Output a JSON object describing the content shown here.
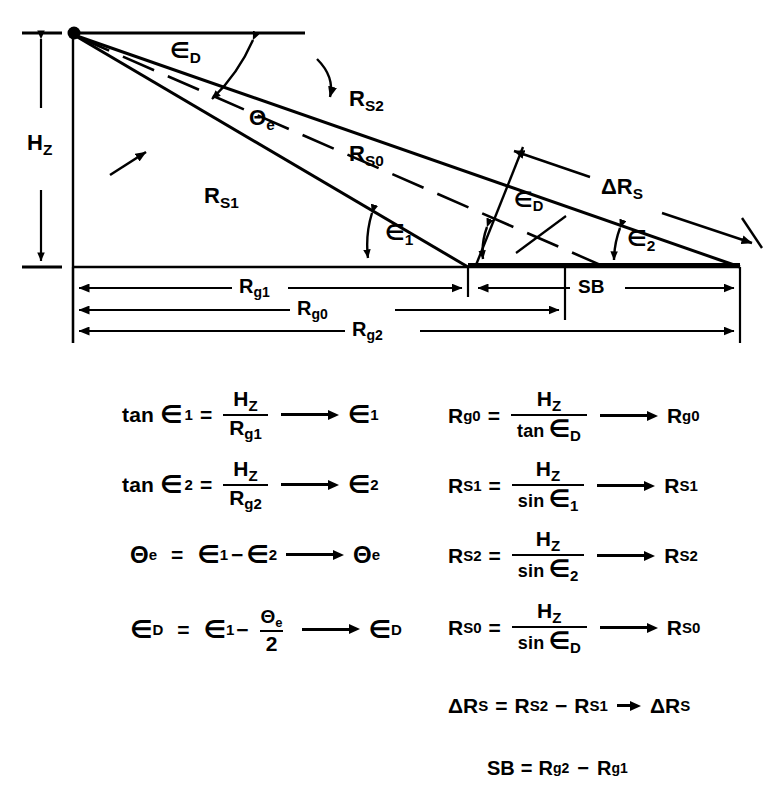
{
  "figure": {
    "type": "geometry-diagram",
    "colors": {
      "line": "#000000",
      "background": "#ffffff"
    },
    "labels": {
      "height": "H",
      "height_sub": "Z",
      "ray_upper": "R",
      "ray_upper_sub": "S2",
      "ray_middle": "R",
      "ray_middle_sub": "S0",
      "ray_lower": "R",
      "ray_lower_sub": "S1",
      "angle_depression": "∈",
      "angle_depression_sub": "D",
      "angle_beam": "Θ",
      "angle_beam_sub": "e",
      "angle_near": "∈",
      "angle_near_sub": "1",
      "angle_far": "∈",
      "angle_far_sub": "2",
      "delta_range": "ΔR",
      "delta_range_sub": "S",
      "swath": "SB",
      "ground_near": "R",
      "ground_near_sub": "g1",
      "ground_center": "R",
      "ground_center_sub": "g0",
      "ground_far": "R",
      "ground_far_sub": "g2"
    },
    "geometry": {
      "apex": [
        73,
        33
      ],
      "baseline_left": [
        73,
        267
      ],
      "baseline_right": [
        740,
        267
      ],
      "near_ground_point": [
        468,
        267
      ],
      "center_ground_point": [
        565,
        267
      ],
      "top_reference_right": [
        305,
        33
      ],
      "dimension_rows_y": [
        288,
        310,
        331
      ],
      "hz_dimension_x": 41
    }
  },
  "equations": {
    "left_column": [
      {
        "id": "eq-tan-eps1",
        "lhs_fn": "tan",
        "lhs_sym": "∈",
        "lhs_sub": "1",
        "eq": "=",
        "num": "H",
        "num_sub": "Z",
        "den": "R",
        "den_sub": "g1",
        "result": "∈",
        "result_sub": "1"
      },
      {
        "id": "eq-tan-eps2",
        "lhs_fn": "tan",
        "lhs_sym": "∈",
        "lhs_sub": "2",
        "eq": "=",
        "num": "H",
        "num_sub": "Z",
        "den": "R",
        "den_sub": "g2",
        "result": "∈",
        "result_sub": "2"
      },
      {
        "id": "eq-theta-e",
        "lhs_sym": "Θ",
        "lhs_sub": "e",
        "eq": "=",
        "term1": "∈",
        "term1_sub": "1",
        "op": "−",
        "term2": "∈",
        "term2_sub": "2",
        "result": "Θ",
        "result_sub": "e"
      },
      {
        "id": "eq-eps-d",
        "lhs_sym": "∈",
        "lhs_sub": "D",
        "eq": "=",
        "term1": "∈",
        "term1_sub": "1",
        "op": "−",
        "num": "Θ",
        "num_sub": "e",
        "den": "2",
        "result": "∈",
        "result_sub": "D"
      }
    ],
    "right_column": [
      {
        "id": "eq-rg0",
        "lhs_sym": "R",
        "lhs_sub": "g0",
        "eq": "=",
        "num": "H",
        "num_sub": "Z",
        "den_fn": "tan",
        "den": "∈",
        "den_sub": "D",
        "result": "R",
        "result_sub": "g0"
      },
      {
        "id": "eq-rs1",
        "lhs_sym": "R",
        "lhs_sub": "S1",
        "eq": "=",
        "num": "H",
        "num_sub": "Z",
        "den_fn": "sin",
        "den": "∈",
        "den_sub": "1",
        "result": "R",
        "result_sub": "S1"
      },
      {
        "id": "eq-rs2",
        "lhs_sym": "R",
        "lhs_sub": "S2",
        "eq": "=",
        "num": "H",
        "num_sub": "Z",
        "den_fn": "sin",
        "den": "∈",
        "den_sub": "2",
        "result": "R",
        "result_sub": "S2"
      },
      {
        "id": "eq-rs0",
        "lhs_sym": "R",
        "lhs_sub": "S0",
        "eq": "=",
        "num": "H",
        "num_sub": "Z",
        "den_fn": "sin",
        "den": "∈",
        "den_sub": "D",
        "result": "R",
        "result_sub": "S0"
      },
      {
        "id": "eq-delta-rs",
        "lhs_sym": "ΔR",
        "lhs_sub": "S",
        "eq": "=",
        "term1": "R",
        "term1_sub": "S2",
        "op": "−",
        "term2": "R",
        "term2_sub": "S1",
        "result": "ΔR",
        "result_sub": "S"
      },
      {
        "id": "eq-sb",
        "lhs_sym": "SB",
        "eq": "=",
        "term1": "R",
        "term1_sub": "g2",
        "op": "−",
        "term2": "R",
        "term2_sub": "g1"
      }
    ]
  }
}
